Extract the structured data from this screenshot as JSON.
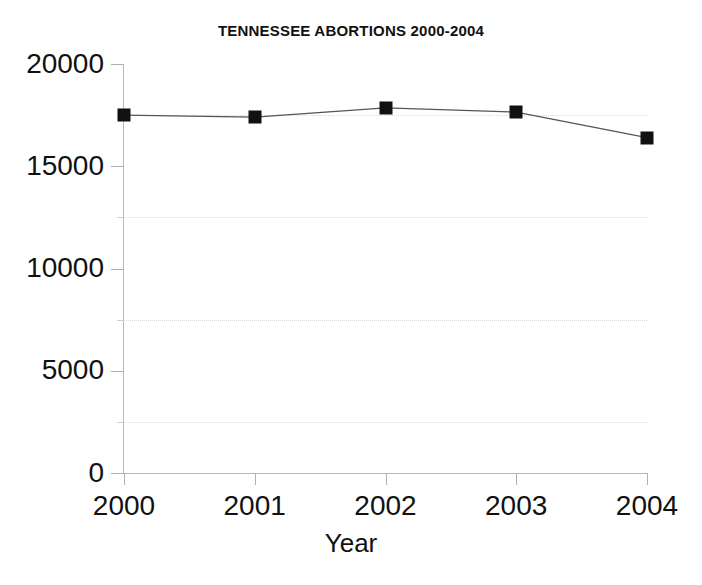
{
  "chart_data": {
    "type": "line",
    "title": "TENNESSEE ABORTIONS 2000-2004",
    "xlabel": "Year",
    "ylabel": "",
    "categories": [
      "2000",
      "2001",
      "2002",
      "2003",
      "2004"
    ],
    "x": [
      2000,
      2001,
      2002,
      2003,
      2004
    ],
    "values": [
      17500,
      17400,
      17850,
      17650,
      16400
    ],
    "series": [
      {
        "name": "Abortions",
        "values": [
          17500,
          17400,
          17850,
          17650,
          16400
        ]
      }
    ],
    "xlim": [
      2000,
      2004
    ],
    "ylim": [
      0,
      20000
    ],
    "ytick_labels": [
      "0",
      "5000",
      "10000",
      "15000",
      "20000"
    ],
    "ytick_values": [
      0,
      5000,
      10000,
      15000,
      20000
    ],
    "yminor_values": [
      2500,
      7500,
      12500,
      17500
    ],
    "gridlines": {
      "horizontal": true,
      "vertical": false,
      "style": "dotted",
      "color": "#d9d9d9",
      "at_values": [
        2500,
        7500,
        12500,
        17500
      ]
    },
    "legend": null,
    "legend_position": "none",
    "marker": "square",
    "marker_color": "#111111",
    "line_color": "#555555",
    "background_color": "#ffffff",
    "axis_color": "#b9b9b9"
  },
  "axis": {
    "y_labels": [
      "20000",
      "15000",
      "10000",
      "5000",
      "0"
    ],
    "x_labels": [
      "2000",
      "2001",
      "2002",
      "2003",
      "2004"
    ],
    "x_title": "Year"
  }
}
